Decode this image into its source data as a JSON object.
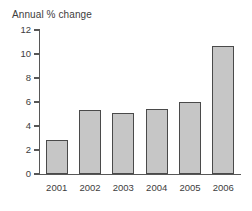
{
  "chart_data": {
    "type": "bar",
    "title": "Annual % change",
    "subtitle": "",
    "xlabel": "",
    "ylabel": "",
    "categories": [
      "2001",
      "2002",
      "2003",
      "2004",
      "2005",
      "2006"
    ],
    "values": [
      2.8,
      5.3,
      5.1,
      5.4,
      6.0,
      10.7
    ],
    "ylim": [
      0,
      12
    ],
    "yticks": [
      0,
      2,
      4,
      6,
      8,
      10,
      12
    ],
    "ytick_labels": [
      "0",
      "2",
      "4",
      "6",
      "8",
      "10",
      "12"
    ],
    "grid": false,
    "legend": false,
    "legend_position": "none",
    "bar_color": "#c6c6c6",
    "bar_border_color": "#4a4a4a",
    "axis_color": "#575757",
    "text_color": "#3d3d3d",
    "background": "#ffffff"
  }
}
